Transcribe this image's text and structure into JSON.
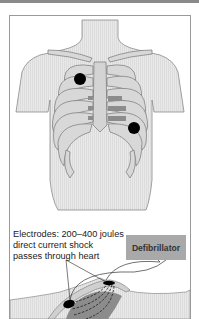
{
  "figure": {
    "caption_lines": [
      "Electrodes: 200–400 joules",
      "direct current shock",
      "passes through heart"
    ],
    "device_label": "Defibrillator",
    "colors": {
      "body_fill": "#e6e6e6",
      "rib_fill": "#d8d8d8",
      "rib_stroke": "#7a7a7a",
      "heart_fill": "#8c8c8c",
      "electrode": "#000000",
      "device_fill": "#a9a9a9",
      "frame_border": "#9a9a9a"
    },
    "electrodes_front": [
      {
        "name": "upper-right-chest-electrode",
        "cx": 80,
        "cy": 79
      },
      {
        "name": "lower-left-chest-electrode",
        "cx": 134,
        "cy": 128
      }
    ]
  }
}
